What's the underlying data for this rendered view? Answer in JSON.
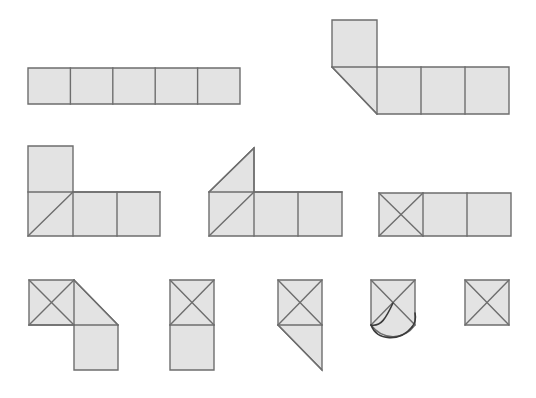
{
  "figure": {
    "background_color": "#ffffff",
    "fill_color": "#e3e3e3",
    "stroke_color": "#6e6e6e",
    "curve_color": "#3a3a3a",
    "width": 536,
    "height": 398,
    "cell_size": 42.5,
    "row_count": 3,
    "shape_count": 10
  },
  "shapes": [
    {
      "id": "shape-1",
      "name": "row-of-five-squares",
      "row": 1,
      "position": 1,
      "origin": {
        "x": 28,
        "y": 68
      },
      "cells": 5,
      "description": "1 by 5 horizontal strip of squares",
      "outline": "28,68 240,68 240,104 28,104",
      "interior_lines": [
        "70.4,68 70.4,104",
        "112.8,68 112.8,104",
        "155.2,68 155.2,104",
        "197.6,68 197.6,104"
      ],
      "curves": []
    },
    {
      "id": "shape-2",
      "name": "L-net-with-corner-triangle",
      "row": 1,
      "position": 2,
      "origin": {
        "x": 332,
        "y": 20
      },
      "cells": 4,
      "description": "Square on top-left above a row of three squares; leftmost lower cell is a lower-right triangle",
      "outline": "332,20 377,20 377,67 509,67 509,114 377,114 332,114 332,67",
      "outline_path": "M332,20 L377,20 L377,67 L509,67 L509,114 L377,114 L332,67 Z",
      "interior_lines": [
        "332,67 377,67",
        "377,67 377,114",
        "421,67 421,114",
        "465,67 465,114",
        "332,67 377,114"
      ],
      "curves": []
    },
    {
      "id": "shape-3",
      "name": "L-net-with-diagonal",
      "row": 2,
      "position": 1,
      "origin": {
        "x": 28,
        "y": 146
      },
      "cells": 4,
      "description": "Square on top-left above a row of three squares; leftmost lower cell has a rising diagonal",
      "outline": "28,146 73,146 73,192 160,192 160,236 28,236",
      "outline_path": "M28,146 L73,146 L73,192 L160,192 L160,236 L28,236 Z",
      "interior_lines": [
        "28,192 160,192",
        "73,192 73,236",
        "117,192 117,236",
        "28,236 73,192"
      ],
      "curves": []
    },
    {
      "id": "shape-4",
      "name": "triangle-top-net-with-diagonal",
      "row": 2,
      "position": 2,
      "origin": {
        "x": 209,
        "y": 148
      },
      "cells": 4,
      "description": "Upper-right triangle above a row of three squares; leftmost lower cell has a rising diagonal",
      "outline_path": "M209,192 L254,148 L254,192 L342,192 L342,236 L209,236 Z",
      "interior_lines": [
        "209,192 342,192",
        "254,192 254,236",
        "298,192 298,236",
        "209,236 254,192",
        "209,192 254,148",
        "254,148 254,192"
      ],
      "curves": []
    },
    {
      "id": "shape-5",
      "name": "row-of-three-with-X",
      "row": 2,
      "position": 3,
      "origin": {
        "x": 379,
        "y": 193
      },
      "cells": 3,
      "description": "1 by 3 horizontal strip; leftmost cell crossed by both diagonals",
      "outline": "379,193 511,193 511,236 379,236",
      "interior_lines": [
        "423,193 423,236",
        "467,193 467,236",
        "379,193 423,236",
        "423,193 379,236"
      ],
      "curves": []
    },
    {
      "id": "shape-6",
      "name": "stepped-net-with-X",
      "row": 3,
      "position": 1,
      "origin": {
        "x": 29,
        "y": 280
      },
      "cells": 3,
      "description": "X-crossed square at top-left, lower-right triangle beside it, square below-right",
      "outline_path": "M29,280 L74,280 L118,325 L118,370 L74,370 L74,325 L29,325 Z",
      "interior_lines": [
        "29,280 74,325",
        "74,280 29,325",
        "74,280 74,325",
        "29,325 74,325",
        "74,325 118,325",
        "74,280 118,325"
      ],
      "curves": []
    },
    {
      "id": "shape-7",
      "name": "vertical-domino-with-X",
      "row": 3,
      "position": 2,
      "origin": {
        "x": 170,
        "y": 280
      },
      "cells": 2,
      "description": "1 by 2 vertical strip; top cell crossed by both diagonals",
      "outline": "170,280 214,280 214,370 170,370",
      "interior_lines": [
        "170,325 214,325",
        "170,280 214,325",
        "214,280 170,325"
      ],
      "curves": []
    },
    {
      "id": "shape-8",
      "name": "X-square-over-triangle",
      "row": 3,
      "position": 3,
      "origin": {
        "x": 278,
        "y": 280
      },
      "cells": 2,
      "description": "X-crossed square above a lower-left triangle",
      "outline_path": "M278,280 L322,280 L322,325 L322,370 L278,325 Z",
      "interior_lines": [
        "278,280 322,325",
        "322,280 278,325",
        "278,325 322,325",
        "278,325 322,370"
      ],
      "curves": []
    },
    {
      "id": "shape-9",
      "name": "X-square-with-folded-flap",
      "row": 3,
      "position": 4,
      "origin": {
        "x": 371,
        "y": 280
      },
      "cells": 1,
      "description": "X-crossed square whose bottom edge bows outward into a curved folded flap",
      "outline_path": "M371,280 L415,280 L415,322 L415,325 C404,340 383,341 371,325 Z",
      "interior_lines": [
        "371,280 415,325",
        "415,280 371,325"
      ],
      "curves": [
        "M371,325 C377,341 400,342 412,327",
        "M393,303 C386,318 381,327 371,325",
        "M412,327 C416,322 416,318 415,313"
      ]
    },
    {
      "id": "shape-10",
      "name": "single-square-with-X",
      "row": 3,
      "position": 5,
      "origin": {
        "x": 465,
        "y": 280
      },
      "cells": 1,
      "description": "Single square crossed by both diagonals",
      "outline": "465,280 509,280 509,325 465,325",
      "interior_lines": [
        "465,280 509,325",
        "509,280 465,325"
      ],
      "curves": []
    }
  ]
}
